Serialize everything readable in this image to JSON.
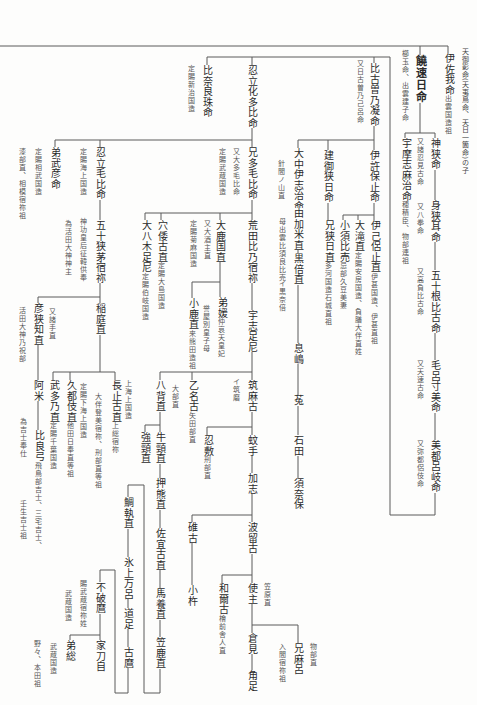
{
  "title_note": "天御影命(天夷鳥命、天日一箇命)の子",
  "persons": {
    "isaga": {
      "name": "伊佐我命",
      "note": "出雲国造祖"
    },
    "nigihayahi": {
      "name": "饒速日命",
      "notes": [
        "櫛玉命、出雲建子命"
      ]
    },
    "kamusa": {
      "name": "神狭命",
      "parent": "nigihayahi",
      "notes": [
        "又諸忍見古命"
      ]
    },
    "umashimaji": {
      "name": "宇摩志麻治命",
      "parent": "nigihayahi",
      "note": "穂積臣、物部連祖"
    },
    "musamimi": {
      "name": "身狭耳命",
      "parent": "kamusa",
      "notes": [
        "又八拳命"
      ]
    },
    "isonehiko": {
      "name": "五十根比古命",
      "parent": "musamimi",
      "notes": [
        "又高負比古命"
      ]
    },
    "morosumi": {
      "name": "毛呂寸美命",
      "parent": "isonehiko",
      "notes": [
        "又天速古命"
      ]
    },
    "mitsuroki": {
      "name": "美都呂岐命",
      "parent": "morosumi",
      "notes": [
        "又弥都侶伎命"
      ]
    },
    "hikosono": {
      "name": "比古曽乃凝命",
      "parent": "mitsuroki",
      "notes": [
        "又日古曽乃己呂命"
      ]
    },
    "ikohoto": {
      "name": "伊許保止命",
      "parent": "hikosono"
    },
    "takemisahi": {
      "name": "建御狭日命",
      "parent": "hikosono"
    },
    "onakaishiji": {
      "name": "大中伊志治命",
      "parent": "hikosono",
      "notes": [
        "針間ノ山直"
      ]
    },
    "yukame": {
      "name": "由加米直",
      "parent": "onakaishiji",
      "notes": [
        "母出雲比須良比売"
      ]
    },
    "kurobe": {
      "name": "黒倍直",
      "parent": "yukame",
      "notes": [
        "イ黒奈倍"
      ]
    },
    "okishima": {
      "name": "息嶋",
      "parent": "kurobe"
    },
    "u": {
      "name": "菟",
      "parent": "okishima"
    },
    "ishida": {
      "name": "石田",
      "parent": "u"
    },
    "sunaho": {
      "name": "須奈保",
      "parent": "ishida"
    },
    "ekoroto": {
      "name": "伊己侶止直",
      "parent": "ikohoto",
      "note": "伊甚国造、伊甚直祖"
    },
    "otaki": {
      "name": "大滝直",
      "parent": "ikohoto",
      "note": "定賜安房国造、負膳大伴直姓"
    },
    "kosuhime": {
      "name": "小須比売",
      "parent": "ikohoto",
      "note": "忌部久豆美妻"
    },
    "esahi": {
      "name": "兄狭日直",
      "parent": "takemisahi",
      "note": "多河国造石城直祖"
    },
    "hinarasu": {
      "name": "比奈良珠命",
      "parent": "mitsuroki",
      "notes": [
        "定賜新治国造"
      ]
    },
    "oshitachikata": {
      "name": "忍立化多比命",
      "parent": "mitsuroki"
    },
    "etamohi": {
      "name": "兄多毛比命",
      "parent": "oshitachikata",
      "notes": [
        "又大多毛比命",
        "定賜武蔵国造"
      ]
    },
    "aratahino": {
      "name": "荒田比乃宿祢",
      "parent": "etamohi"
    },
    "ushi": {
      "name": "宇志足尼",
      "parent": "aratahino"
    },
    "oka": {
      "name": "大鹿国直",
      "parent": "etamohi",
      "notes": [
        "又大酒主直",
        "定賜菊麻国造"
      ]
    },
    "ototohime": {
      "name": "弟媛",
      "parent": "oka",
      "note": "仲哀天皇妃",
      "notes": [
        "誉屋別皇子母"
      ]
    },
    "koka": {
      "name": "小鹿直",
      "parent": "oka",
      "note": "来熊田造祖"
    },
    "anawako": {
      "name": "穴倭古直",
      "parent": "etamohi",
      "note": "定賜大島国造"
    },
    "oyagi": {
      "name": "大八木足尼",
      "parent": "etamohi",
      "note": "定賜伯岐国造"
    },
    "tsukumako": {
      "name": "筑麻古",
      "parent": "ushi",
      "notes": [
        "イ筑磨"
      ]
    },
    "otonako": {
      "name": "乙名古",
      "parent": "ushi",
      "note": "矢田部直"
    },
    "yase": {
      "name": "八背直",
      "parent": "ushi",
      "notes": [
        "大部直"
      ]
    },
    "kate": {
      "name": "蚊手",
      "parent": "tsukumako"
    },
    "oshishiki": {
      "name": "忍敷",
      "parent": "tsukumako",
      "note": "刑部直"
    },
    "kashi": {
      "name": "加志",
      "parent": "kate"
    },
    "haruko": {
      "name": "波留古",
      "parent": "kashi"
    },
    "usuko": {
      "name": "碓古",
      "parent": "kashi"
    },
    "okine": {
      "name": "小杵",
      "parent": "usuko"
    },
    "omi": {
      "name": "使主",
      "parent": "haruko",
      "notes": [
        "笠原直"
      ]
    },
    "waniko": {
      "name": "和爾古",
      "parent": "haruko",
      "note": "檜前舎人直"
    },
    "kurami": {
      "name": "倉見",
      "parent": "omi"
    },
    "tsunotari": {
      "name": "角足",
      "parent": "kurami"
    },
    "emaro": {
      "name": "兄麻呂",
      "parent": "omi",
      "notes": [
        "物部直",
        "入間宿祢祖"
      ]
    },
    "kowakubi": {
      "name": "強頸直",
      "parent": "yase"
    },
    "ushikubi": {
      "name": "牛頸直",
      "parent": "yase"
    },
    "oshikuma": {
      "name": "押熊直",
      "parent": "ushikubi"
    },
    "sakiko": {
      "name": "佐宜古直",
      "parent": "oshikuma"
    },
    "umakai": {
      "name": "馬養直",
      "parent": "sakiko"
    },
    "kasaka": {
      "name": "笠鹿直",
      "parent": "umakai"
    },
    "taitori": {
      "name": "鯛執直",
      "parent": "kasaka"
    },
    "hikamimaro": {
      "name": "氷上万呂",
      "parent": "taitori"
    },
    "michitari": {
      "name": "道足",
      "parent": "hikamimaro"
    },
    "komaro": {
      "name": "古麿",
      "parent": "michitari"
    },
    "fuwamaro": {
      "name": "不破麿",
      "parent": "komaro",
      "notes": [
        "賜武蔵宿祢姓",
        "武蔵国造"
      ]
    },
    "ietoji": {
      "name": "家刀自",
      "parent": "fuwamaro"
    },
    "otofusa": {
      "name": "弟総",
      "parent": "fuwamaro",
      "notes": [
        "武蔵国造",
        "野々、本田祖"
      ]
    },
    "oshitachimohi": {
      "name": "忍立毛比命",
      "parent": "oshitachikata",
      "notes": [
        "定賜海上国造"
      ]
    },
    "ototakehiko": {
      "name": "弟武彦命",
      "parent": "oshitachikata",
      "notes": [
        "定賜相武国造",
        "漆部直、相模宿祢祖"
      ]
    },
    "isasachi": {
      "name": "五十狭茅宿祢",
      "parent": "oshitachimohi",
      "notes": [
        "神功皇后征韓供奉",
        "為活田大神神主"
      ]
    },
    "inaniwa": {
      "name": "稲庭直",
      "parent": "isasachi"
    },
    "hikosachi": {
      "name": "彦狭知直",
      "parent": "isasachi",
      "notes": [
        "又諸手直",
        "活田大神乃祝部"
      ]
    },
    "ame": {
      "name": "阿米",
      "parent": "hikosachi"
    },
    "hirayumi": {
      "name": "比良弓",
      "parent": "ame",
      "note": "飛鳥部吉士、三宅吉士、",
      "notes": [
        "壬生吉士祖",
        "為吉士奉仕"
      ]
    },
    "nagatoko": {
      "name": "長止古直",
      "parent": "inaniwa",
      "note": "上総宿祢",
      "notes": [
        "上海上国造",
        "大伴登美宿祢、刑部直等祖"
      ]
    },
    "kutsuki": {
      "name": "久都伎直",
      "parent": "inaniwa",
      "note": "他田日奉直等祖",
      "notes": [
        "定賜下海上国造"
      ]
    },
    "takeno": {
      "name": "武多乃直",
      "parent": "inaniwa",
      "note": "定賜千葉国造"
    }
  }
}
